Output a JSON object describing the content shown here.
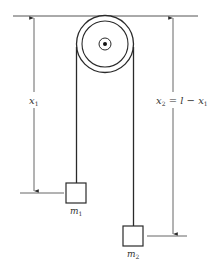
{
  "diagram": {
    "type": "atwood-machine",
    "colors": {
      "line": "#2a2a2a",
      "thin_line": "#555555",
      "background": "#ffffff"
    },
    "labels": {
      "x1_var": "x",
      "x1_sub": "1",
      "x2_var": "x",
      "x2_sub": "2",
      "x2_eq": " = l − x",
      "x2_eq_sub": "1",
      "m1_var": "m",
      "m1_sub": "1",
      "m2_var": "m",
      "m2_sub": "2"
    },
    "elements": {
      "ceiling": "ceiling-line",
      "pulley": "pulley",
      "mass1": "m1",
      "mass2": "m2",
      "dimension_left": "x1",
      "dimension_right": "x2 = l - x1"
    }
  }
}
